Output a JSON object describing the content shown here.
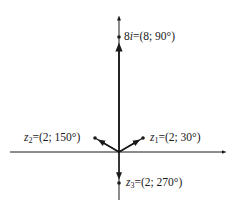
{
  "diagram": {
    "type": "complex-plane-vectors",
    "origin": [
      119,
      152
    ],
    "colors": {
      "ink": "#1a1a1a",
      "background": "#ffffff"
    },
    "points": [
      {
        "id": "8i",
        "name_main": "8",
        "name_var": "i",
        "sub": "",
        "value": "=(8; 90°)",
        "x": 119,
        "y": 37,
        "modulus": 8,
        "angle_deg": 90
      },
      {
        "id": "z1",
        "name_main": "",
        "name_var": "z",
        "sub": "1",
        "value": "=(2; 30°)",
        "x": 143,
        "y": 138,
        "modulus": 2,
        "angle_deg": 30
      },
      {
        "id": "z2",
        "name_main": "",
        "name_var": "z",
        "sub": "2",
        "value": "=(2; 150°)",
        "x": 95,
        "y": 138,
        "modulus": 2,
        "angle_deg": 150
      },
      {
        "id": "z3",
        "name_main": "",
        "name_var": "z",
        "sub": "3",
        "value": "=(2; 270°)",
        "x": 119,
        "y": 183,
        "modulus": 2,
        "angle_deg": 270
      }
    ]
  }
}
